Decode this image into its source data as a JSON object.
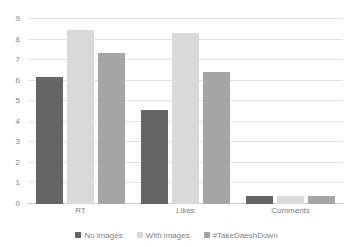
{
  "chart_data": {
    "type": "bar",
    "title": "",
    "subtitle": "",
    "xlabel": "",
    "ylabel": "",
    "categories": [
      "RT",
      "Likes",
      "Comments"
    ],
    "series": [
      {
        "name": "No images",
        "color": "#656565",
        "values": [
          6.2,
          4.55,
          0.4
        ]
      },
      {
        "name": "With images",
        "color": "#d9d9d9",
        "values": [
          8.45,
          8.3,
          0.4
        ]
      },
      {
        "name": "#TakeDaeshDown",
        "color": "#a5a5a5",
        "values": [
          7.35,
          6.4,
          0.4
        ]
      }
    ],
    "ylim": [
      0,
      9
    ],
    "y_ticks": [
      0,
      1,
      2,
      3,
      4,
      5,
      6,
      7,
      8,
      9
    ],
    "y_tick_labels": [
      "0",
      "1",
      "2",
      "3",
      "4",
      "5",
      "6",
      "7",
      "8",
      "9"
    ],
    "grid": true,
    "grid_axis": "y",
    "legend_position": "bottom",
    "background_color": "#ffffff",
    "gridline_color": "#e2e2e2",
    "axis_color": "#c9c9c9",
    "tick_label_color": "#7f7f7f"
  }
}
